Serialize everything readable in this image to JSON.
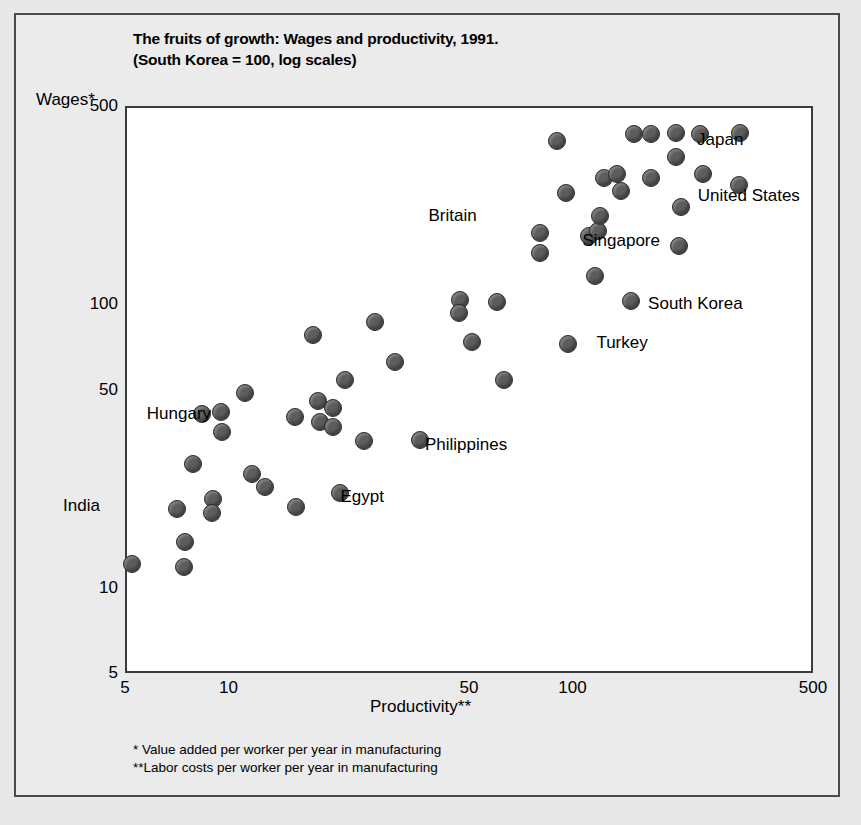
{
  "figure": {
    "title_line1": "The fruits of growth: Wages and productivity, 1991.",
    "title_line2": "(South Korea = 100, log scales)",
    "y_axis_title": "Wages*",
    "x_axis_title": "Productivity**",
    "footnote1": "* Value added per worker per year in manufacturing",
    "footnote2": "**Labor costs per worker per year in manufacturing",
    "frame_color": "#4a4a4a",
    "plot_background": "#ffffff",
    "page_background": "#e8e8e8",
    "marker_color": "#5d5d5d",
    "marker_edge_color": "#2e2e2e"
  },
  "chart_data": {
    "type": "scatter",
    "title": "The fruits of growth: Wages and productivity, 1991. (South Korea = 100, log scales)",
    "xlabel": "Productivity**",
    "ylabel": "Wages*",
    "xscale": "log",
    "yscale": "log",
    "xlim": [
      5,
      500
    ],
    "ylim": [
      5,
      500
    ],
    "xticks": [
      5,
      10,
      50,
      100,
      500
    ],
    "xtick_labels": [
      "5",
      "10",
      "50",
      "100",
      "500"
    ],
    "yticks": [
      5,
      10,
      50,
      100,
      500
    ],
    "ytick_labels": [
      "5",
      "10",
      "50",
      "100",
      "500"
    ],
    "grid": false,
    "legend": false,
    "annotations": [
      {
        "text": "India",
        "x": 5.0,
        "y": 15.5
      },
      {
        "text": "Hungary",
        "x": 11.0,
        "y": 41.0
      },
      {
        "text": "Egypt",
        "x": 19.0,
        "y": 21.5
      },
      {
        "text": "Philippines",
        "x": 33.0,
        "y": 35.0
      },
      {
        "text": "Britain",
        "x": 66.0,
        "y": 215.0
      },
      {
        "text": "Singapore",
        "x": 96.0,
        "y": 170.0
      },
      {
        "text": "South Korea",
        "x": 147.0,
        "y": 100.0
      },
      {
        "text": "Turkey",
        "x": 104.0,
        "y": 78.0
      },
      {
        "text": "Japan",
        "x": 204.0,
        "y": 385.0
      },
      {
        "text": "United States",
        "x": 205.0,
        "y": 245.0
      }
    ],
    "points": [
      {
        "px": 132,
        "py": 564,
        "x": 5.1,
        "y": 9.8
      },
      {
        "px": 177,
        "py": 509,
        "x": 8.8,
        "y": 17.0
      },
      {
        "px": 185,
        "py": 542,
        "x": 9.5,
        "y": 12.4
      },
      {
        "px": 184,
        "py": 567,
        "x": 9.4,
        "y": 9.6
      },
      {
        "px": 193,
        "py": 464,
        "x": 10.3,
        "y": 26.7
      },
      {
        "px": 213,
        "py": 499,
        "x": 12.4,
        "y": 18.6
      },
      {
        "px": 212,
        "py": 513,
        "x": 12.3,
        "y": 16.3
      },
      {
        "px": 222,
        "py": 432,
        "x": 13.5,
        "y": 35.0
      },
      {
        "px": 221,
        "py": 412,
        "x": 13.4,
        "y": 41.0
      },
      {
        "px": 202,
        "py": 414,
        "x": 11.4,
        "y": 40.5
      },
      {
        "px": 245,
        "py": 393,
        "x": 16.5,
        "y": 47.7
      },
      {
        "px": 252,
        "py": 474,
        "x": 17.5,
        "y": 24.5
      },
      {
        "px": 265,
        "py": 487,
        "x": 19.4,
        "y": 22.2
      },
      {
        "px": 295,
        "py": 417,
        "x": 24.5,
        "y": 39.6
      },
      {
        "px": 296,
        "py": 507,
        "x": 24.6,
        "y": 19.4
      },
      {
        "px": 318,
        "py": 401,
        "x": 28.9,
        "y": 44.7
      },
      {
        "px": 320,
        "py": 422,
        "x": 29.3,
        "y": 38.2
      },
      {
        "px": 333,
        "py": 408,
        "x": 32.2,
        "y": 42.3
      },
      {
        "px": 333,
        "py": 427,
        "x": 32.2,
        "y": 36.6
      },
      {
        "px": 313,
        "py": 335,
        "x": 27.9,
        "y": 77.0
      },
      {
        "px": 345,
        "py": 380,
        "x": 34.9,
        "y": 52.4
      },
      {
        "px": 340,
        "py": 493,
        "x": 33.8,
        "y": 21.7
      },
      {
        "px": 364,
        "py": 441,
        "x": 39.9,
        "y": 33.3
      },
      {
        "px": 375,
        "py": 322,
        "x": 42.9,
        "y": 85.0
      },
      {
        "px": 395,
        "py": 362,
        "x": 48.9,
        "y": 60.5
      },
      {
        "px": 420,
        "py": 440,
        "x": 57.5,
        "y": 33.5
      },
      {
        "px": 460,
        "py": 300,
        "x": 75.0,
        "y": 97.0
      },
      {
        "px": 459,
        "py": 313,
        "x": 74.8,
        "y": 88.0
      },
      {
        "px": 472,
        "py": 342,
        "x": 80.5,
        "y": 70.0
      },
      {
        "px": 497,
        "py": 302,
        "x": 93.0,
        "y": 96.0
      },
      {
        "px": 504,
        "py": 380,
        "x": 96.5,
        "y": 52.5
      },
      {
        "px": 540,
        "py": 233,
        "x": 118.0,
        "y": 162.0
      },
      {
        "px": 540,
        "py": 253,
        "x": 118.0,
        "y": 138.0
      },
      {
        "px": 568,
        "py": 344,
        "x": 136.0,
        "y": 69.0
      },
      {
        "px": 557,
        "py": 141,
        "x": 129.0,
        "y": 320.0
      },
      {
        "px": 566,
        "py": 193,
        "x": 134.0,
        "y": 215.0
      },
      {
        "px": 589,
        "py": 236,
        "x": 149.0,
        "y": 158.0
      },
      {
        "px": 598,
        "py": 231,
        "x": 155.0,
        "y": 163.0
      },
      {
        "px": 595,
        "py": 276,
        "x": 153.0,
        "y": 117.0
      },
      {
        "px": 600,
        "py": 216,
        "x": 156.0,
        "y": 182.0
      },
      {
        "px": 604,
        "py": 178,
        "x": 159.0,
        "y": 245.0
      },
      {
        "px": 617,
        "py": 174,
        "x": 168.0,
        "y": 253.0
      },
      {
        "px": 621,
        "py": 191,
        "x": 171.0,
        "y": 222.0
      },
      {
        "px": 631,
        "py": 301,
        "x": 178.0,
        "y": 100.0
      },
      {
        "px": 634,
        "py": 134,
        "x": 180.0,
        "y": 340.0
      },
      {
        "px": 651,
        "py": 134,
        "x": 192.0,
        "y": 340.0
      },
      {
        "px": 651,
        "py": 178,
        "x": 192.0,
        "y": 245.0
      },
      {
        "px": 676,
        "py": 133,
        "x": 212.0,
        "y": 344.0
      },
      {
        "px": 676,
        "py": 157,
        "x": 212.0,
        "y": 288.0
      },
      {
        "px": 681,
        "py": 207,
        "x": 216.0,
        "y": 194.0
      },
      {
        "px": 679,
        "py": 246,
        "x": 214.0,
        "y": 148.0
      },
      {
        "px": 700,
        "py": 134,
        "x": 232.0,
        "y": 340.0
      },
      {
        "px": 703,
        "py": 174,
        "x": 235.0,
        "y": 253.0
      },
      {
        "px": 740,
        "py": 133,
        "x": 273.0,
        "y": 344.0
      },
      {
        "px": 739,
        "py": 185,
        "x": 272.0,
        "y": 232.0
      }
    ]
  }
}
